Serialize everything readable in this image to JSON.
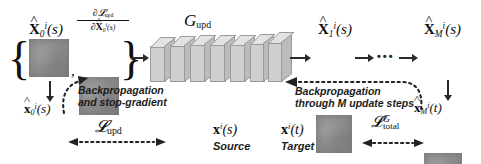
{
  "figure": {
    "background": "#ffffff",
    "ink": "#111111"
  },
  "labels": {
    "input_state": "X̂₀ⁱ(s)",
    "input_grad": "∂L_upd / ∂X̂₀ⁱ(s)",
    "generator": "G_upd",
    "state_1": "X̂₁ⁱ(s)",
    "state_M": "X̂_Mⁱ(s)",
    "recon_0": "x̂₀ⁱ(s)",
    "recon_M": "x̂_Mⁱ(t)",
    "source_img": "xⁱ(s)",
    "source_caption": "Source",
    "target_img": "xⁱ(t)",
    "target_caption": "Target",
    "loss_upd": "L_upd",
    "loss_total": "L_total^G",
    "backprop_left_line1": "Backpropagation",
    "backprop_left_line2": "and stop-gradient",
    "backprop_right_line1": "Backpropagation",
    "backprop_right_line2": "through M update steps",
    "ellipsis": "•••",
    "brace_open": "{",
    "brace_close": "}",
    "comma": ","
  },
  "math_parts": {
    "X": "X",
    "x": "x",
    "G": "G",
    "L": "L",
    "partial": "∂",
    "sub_0": "0",
    "sub_1": "1",
    "sub_M": "M",
    "sub_upd": "upd",
    "sub_total": "total",
    "sup_i": "i",
    "sup_G": "G",
    "paren_s": "(s)",
    "paren_t": "(t)"
  },
  "icons": {
    "arrow_right": "solid-right-arrow",
    "arrow_down": "solid-down-arrow",
    "dotted_arrow": "dotted-arrow",
    "curly_brace": "curly-brace",
    "neural_slab": "neural-network-slab"
  },
  "colors": {
    "feature_map": "#8d8d8d",
    "slab_front": "#cfcfcf",
    "slab_top": "#e3e3e3",
    "slab_side": "#bcbcbc",
    "arrow": "#2a2a2a",
    "text": "#111111"
  },
  "network": {
    "slab_count": 7
  }
}
